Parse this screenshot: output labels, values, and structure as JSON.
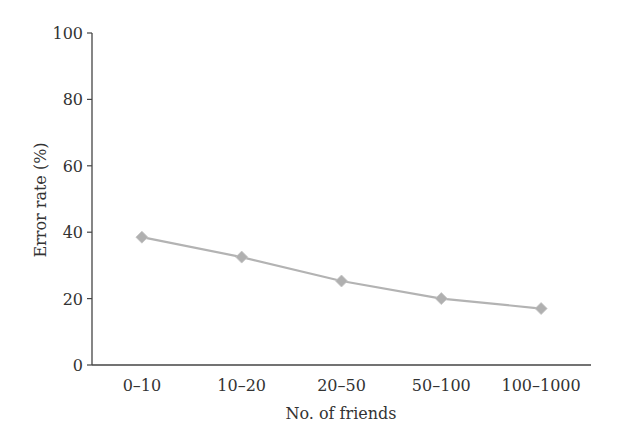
{
  "chart_data": {
    "type": "line",
    "title": "",
    "xlabel": "No. of friends",
    "ylabel": "Error rate (%)",
    "categories": [
      "0–10",
      "10–20",
      "20–50",
      "50–100",
      "100–1000"
    ],
    "series": [
      {
        "name": "Error rate",
        "values": [
          38.5,
          32.5,
          25.3,
          20.0,
          17.0
        ],
        "marker": "diamond",
        "color": "#b3b3b3"
      }
    ],
    "ylim": [
      0,
      100
    ],
    "yticks": [
      0,
      20,
      40,
      60,
      80,
      100
    ],
    "grid": false,
    "legend": null
  },
  "colors": {
    "axis": "#444444",
    "line": "#b3b3b3",
    "marker": "#b0b0b0",
    "text": "#333333"
  }
}
